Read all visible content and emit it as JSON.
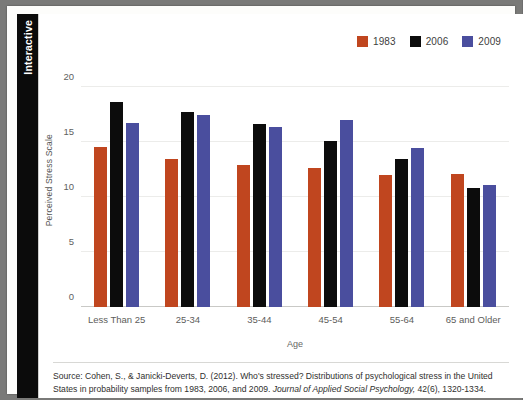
{
  "sidebar": {
    "tab_label": "Interactive"
  },
  "chart_data": {
    "type": "bar",
    "title": "",
    "xlabel": "Age",
    "ylabel": "Perceived Stress Scale",
    "ylim": [
      0,
      21.5
    ],
    "yticks": [
      0,
      5,
      10,
      15,
      20
    ],
    "ytick_labels": [
      "0",
      "5",
      "10",
      "15",
      "20"
    ],
    "grid": true,
    "legend_position": "top-right",
    "categories": [
      "Less Than 25",
      "25-34",
      "35-44",
      "45-54",
      "55-64",
      "65 and Older"
    ],
    "series": [
      {
        "name": "1983",
        "color": "#c0461f",
        "values": [
          14.6,
          13.5,
          12.9,
          12.7,
          12.0,
          12.1
        ]
      },
      {
        "name": "2006",
        "color": "#0c0c0c",
        "values": [
          18.7,
          17.8,
          16.7,
          15.1,
          13.5,
          10.8
        ]
      },
      {
        "name": "2009",
        "color": "#4a4e9e",
        "values": [
          16.8,
          17.5,
          16.4,
          17.0,
          14.5,
          11.1
        ]
      }
    ]
  },
  "source": {
    "line1_part1": "Source: Cohen, S., & Janicki-Deverts, D. (2012). Who's stressed? Distributions of psychological stress in the United States in probability samples from 1983, 2006, and 2009. ",
    "journal": "Journal of Applied Social Psychology,",
    "line1_part2": " 42(6), 1320-1334."
  }
}
